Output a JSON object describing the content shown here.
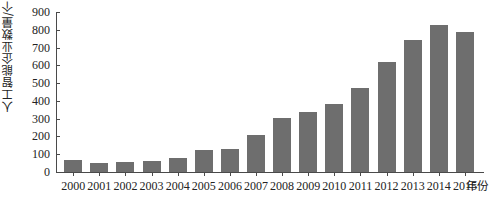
{
  "chart_data": {
    "type": "bar",
    "title": "",
    "subtitle": "",
    "xlabel": "年份",
    "ylabel": "人工智能企业数量/个",
    "categories": [
      "2000",
      "2001",
      "2002",
      "2003",
      "2004",
      "2005",
      "2006",
      "2007",
      "2008",
      "2009",
      "2010",
      "2011",
      "2012",
      "2013",
      "2014",
      "2015"
    ],
    "values": [
      65,
      50,
      55,
      60,
      80,
      125,
      130,
      210,
      305,
      340,
      385,
      470,
      620,
      745,
      825,
      790
    ],
    "series": [
      {
        "name": "人工智能企业数量",
        "values": [
          65,
          50,
          55,
          60,
          80,
          125,
          130,
          210,
          305,
          340,
          385,
          470,
          620,
          745,
          825,
          790
        ]
      }
    ],
    "ylim": [
      0,
      900
    ],
    "y_ticks": [
      "0",
      "100",
      "200",
      "300",
      "400",
      "500",
      "600",
      "700",
      "800",
      "900"
    ],
    "y_tick_values": [
      0,
      100,
      200,
      300,
      400,
      500,
      600,
      700,
      800,
      900
    ],
    "grid": false,
    "legend": false,
    "legend_position": "none",
    "bar_color": "#6e6e6e",
    "axis_color": "#4a4a4a",
    "text_color": "#232323",
    "background": "#ffffff"
  }
}
